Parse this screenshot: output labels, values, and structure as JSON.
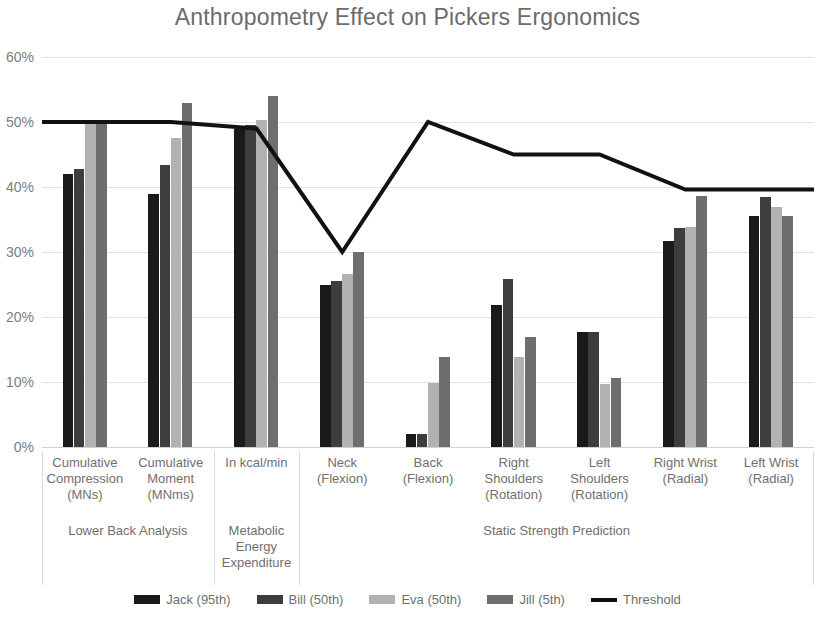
{
  "chart_data": {
    "type": "bar",
    "title": "Anthropometry Effect on Pickers Ergonomics",
    "xlabel": "",
    "ylabel": "",
    "ylim": [
      0,
      60
    ],
    "ytick_labels": [
      "0%",
      "10%",
      "20%",
      "30%",
      "40%",
      "50%",
      "60%"
    ],
    "ytick_values": [
      0,
      10,
      20,
      30,
      40,
      50,
      60
    ],
    "grid": true,
    "legend_position": "bottom",
    "categories": [
      "Cumulative Compression (MNs)",
      "Cumulative Moment (MNms)",
      "In kcal/min",
      "Neck (Flexion)",
      "Back (Flexion)",
      "Right Shoulders (Rotation)",
      "Left Shoulders (Rotation)",
      "Right Wrist (Radial)",
      "Left Wrist (Radial)"
    ],
    "category_lines": [
      [
        "Cumulative",
        "Compression",
        "(MNs)"
      ],
      [
        "Cumulative",
        "Moment",
        "(MNms)"
      ],
      [
        "In kcal/min"
      ],
      [
        "Neck",
        "(Flexion)"
      ],
      [
        "Back",
        "(Flexion)"
      ],
      [
        "Right",
        "Shoulders",
        "(Rotation)"
      ],
      [
        "Left",
        "Shoulders",
        "(Rotation)"
      ],
      [
        "Right Wrist",
        "(Radial)"
      ],
      [
        "Left Wrist",
        "(Radial)"
      ]
    ],
    "category_groups": [
      {
        "label": "Lower Back Analysis",
        "lines": [
          "Lower Back Analysis"
        ],
        "start": 0,
        "end": 1
      },
      {
        "label": "Metabolic Energy Expenditure",
        "lines": [
          "Metabolic",
          "Energy",
          "Expenditure"
        ],
        "start": 2,
        "end": 2
      },
      {
        "label": "Static Strength Prediction",
        "lines": [
          "Static Strength Prediction"
        ],
        "start": 3,
        "end": 8
      }
    ],
    "series": [
      {
        "name": "Jack (95th)",
        "color": "#1a1a1a",
        "values": [
          42.0,
          39.0,
          49.0,
          25.0,
          2.0,
          21.8,
          17.7,
          31.7,
          35.5
        ]
      },
      {
        "name": "Bill (50th)",
        "color": "#3d3d3d",
        "values": [
          42.8,
          43.4,
          49.6,
          25.5,
          2.0,
          25.8,
          17.7,
          33.7,
          38.5
        ]
      },
      {
        "name": "Eva (50th)",
        "color": "#b2b2b2",
        "values": [
          50.2,
          47.6,
          50.3,
          26.6,
          9.8,
          13.8,
          9.7,
          33.9,
          37.0
        ]
      },
      {
        "name": "Jill (5th)",
        "color": "#6e6e6e",
        "values": [
          50.2,
          53.0,
          54.0,
          30.0,
          13.8,
          17.0,
          10.6,
          38.6,
          35.5
        ]
      }
    ],
    "threshold": {
      "name": "Threshold",
      "color": "#111111",
      "values": [
        50.0,
        50.0,
        49.0,
        30.0,
        50.0,
        45.0,
        45.0,
        39.6,
        39.6
      ]
    }
  }
}
